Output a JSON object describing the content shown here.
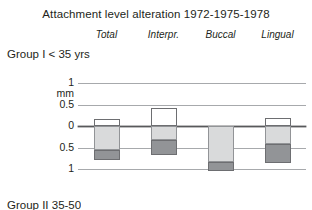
{
  "chart_data": {
    "type": "bar",
    "title": "Attachment level alteration 1972-1975-1978",
    "subtitle": "Group I < 35 yrs",
    "xlabel": "",
    "ylabel": "mm",
    "ylim": [
      1,
      -1
    ],
    "axis_inverted": true,
    "grid": true,
    "legend": "none",
    "categories": [
      "Total",
      "Interpr.",
      "Buccal",
      "Lingual"
    ],
    "y_ticks": [
      "1",
      "0.5",
      "0",
      "0.5",
      "1"
    ],
    "y_tick_values": [
      1,
      0.5,
      0,
      -0.5,
      -1
    ],
    "y_unit": "mm",
    "series": [
      {
        "name": "gain-above-zero",
        "style": "white",
        "values": [
          0.17,
          0.42,
          0.0,
          0.18
        ]
      },
      {
        "name": "loss-light",
        "style": "light-gray",
        "values": [
          -0.56,
          -0.33,
          -0.83,
          -0.43
        ]
      },
      {
        "name": "loss-dark",
        "style": "dark-gray",
        "values": [
          -0.79,
          -0.67,
          -1.05,
          -0.85
        ]
      }
    ],
    "note": "Each bar is drawn as an outlined white segment above the zero line, a light gray segment from zero down, and a dark gray segment continuing to its full depth."
  },
  "header": {
    "title": "Attachment level alteration 1972-1975-1978"
  },
  "columns": [
    {
      "label": "Total"
    },
    {
      "label": "Interpr."
    },
    {
      "label": "Buccal"
    },
    {
      "label": "Lingual"
    }
  ],
  "group": {
    "label": "Group I < 35 yrs"
  },
  "axis": {
    "ticks": [
      {
        "label": "1",
        "unit": "mm"
      },
      {
        "label": "0.5",
        "unit": ""
      },
      {
        "label": "0",
        "unit": ""
      },
      {
        "label": "0.5",
        "unit": ""
      },
      {
        "label": "1",
        "unit": ""
      }
    ]
  },
  "footer": {
    "next_group_label": "Group II 35-50"
  },
  "colors": {
    "text": "#231f20",
    "gridline": "#a7a9ac",
    "zero_line": "#58595b",
    "segment_white_fill": "#ffffff",
    "segment_white_stroke": "#6d6e71",
    "segment_light_fill": "#d9dadb",
    "segment_light_stroke": "#929497",
    "segment_dark_fill": "#929497",
    "segment_dark_stroke": "#6d6e71",
    "background": "#ffffff"
  }
}
